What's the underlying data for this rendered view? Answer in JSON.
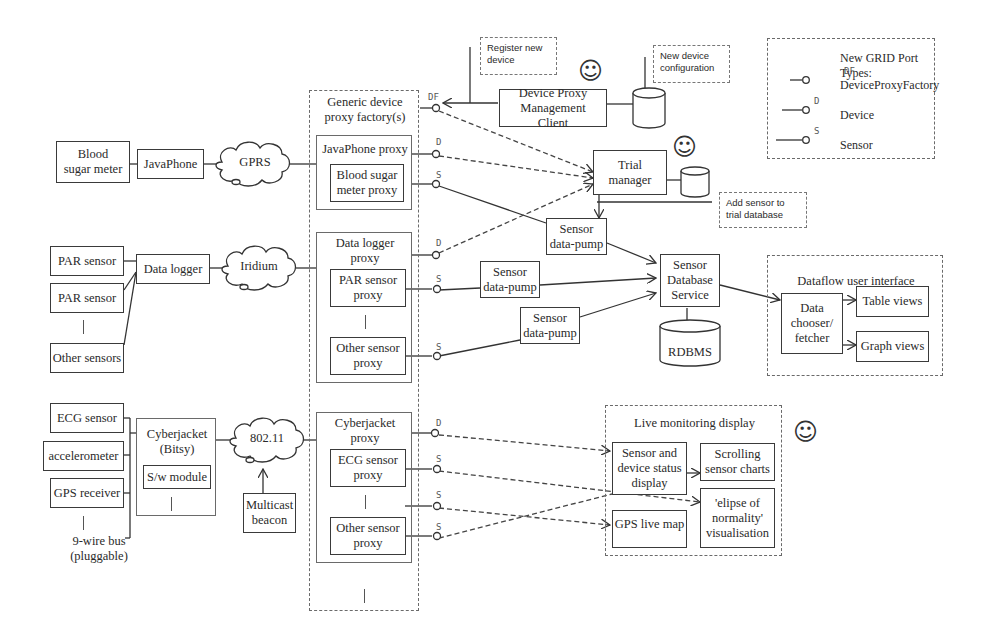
{
  "legend": {
    "title": "New GRID Port Types:",
    "items": [
      {
        "code": "DF",
        "label": "DeviceProxyFactory"
      },
      {
        "code": "D",
        "label": "Device"
      },
      {
        "code": "S",
        "label": "Sensor"
      }
    ]
  },
  "notes": {
    "register": "Register new device",
    "config": "New device configuration",
    "add_sensor": "Add sensor to trial database"
  },
  "factory": {
    "title": "Generic device proxy factory(s)",
    "port": "DF"
  },
  "row1": {
    "device": "Blood sugar meter",
    "gateway": "JavaPhone",
    "network": "GPRS",
    "proxy": "JavaPhone proxy",
    "sub_proxy": "Blood sugar meter proxy",
    "port_d": "D",
    "port_s": "S"
  },
  "row2": {
    "devices": [
      "PAR sensor",
      "PAR sensor",
      "Other sensors"
    ],
    "gateway": "Data logger",
    "network": "Iridium",
    "proxy": "Data logger proxy",
    "sub_proxies": [
      "PAR sensor proxy",
      "Other sensor proxy"
    ],
    "port_d": "D",
    "port_s1": "S",
    "port_s2": "S"
  },
  "row3": {
    "devices": [
      "ECG sensor",
      "accelerometer",
      "GPS receiver"
    ],
    "bus": "9-wire bus (pluggable)",
    "gateway": "Cyberjacket (Bitsy)",
    "module": "S/w module",
    "network": "802.11",
    "beacon": "Multicast beacon",
    "proxy": "Cyberjacket proxy",
    "sub_proxies": [
      "ECG sensor proxy",
      "Other sensor proxy"
    ],
    "port_d": "D",
    "port_s1": "S",
    "port_s2": "S",
    "port_s3": "S"
  },
  "services": {
    "mgmt_client": "Device Proxy Management Client",
    "trial_manager": "Trial manager",
    "pump": "Sensor data-pump",
    "db_service": "Sensor Database Service",
    "rdbms": "RDBMS"
  },
  "dataflow": {
    "title": "Dataflow user interface",
    "chooser": "Data chooser/ fetcher",
    "table": "Table views",
    "graph": "Graph views"
  },
  "live": {
    "title": "Live monitoring display",
    "status": "Sensor and device status display",
    "charts": "Scrolling sensor charts",
    "gps": "GPS live map",
    "ellipse": "'elipse of normality' visualisation"
  },
  "smiley": "☺"
}
